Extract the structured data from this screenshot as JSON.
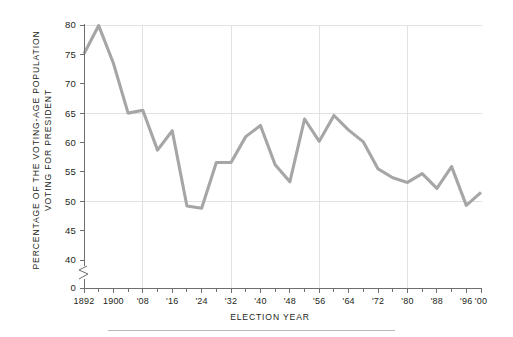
{
  "figure": {
    "background_color": "#ffffff",
    "line_color": "#a6a6a6",
    "grid_color": "#e2e2e2",
    "axis_color": "#6d6e70",
    "text_color": "#231f20"
  },
  "axis_titles": {
    "y_line1": "PERCENTAGE OF THE VOTING-AGE POPULATION",
    "y_line2": "VOTING FOR PRESIDENT",
    "x": "ELECTION  YEAR"
  },
  "y_axis": {
    "ticks": [
      "0",
      "40",
      "45",
      "50",
      "55",
      "60",
      "65",
      "70",
      "75",
      "80"
    ],
    "break_between": [
      "0",
      "40"
    ]
  },
  "x_axis": {
    "tick_labels": [
      "1892",
      "1900",
      "'08",
      "'16",
      "'24",
      "'32",
      "'40",
      "'48",
      "'56",
      "'64",
      "'72",
      "'80",
      "'88",
      "'96",
      "'00"
    ]
  },
  "chart_data": {
    "type": "line",
    "title": "",
    "subtitle": "",
    "xlabel": "ELECTION  YEAR",
    "ylabel": "PERCENTAGE OF THE VOTING-AGE POPULATION VOTING FOR PRESIDENT",
    "ylim": [
      40,
      80
    ],
    "y_break": [
      0,
      40
    ],
    "yticks": [
      0,
      40,
      45,
      50,
      55,
      60,
      65,
      70,
      75,
      80
    ],
    "xlim": [
      1892,
      2000
    ],
    "xticks": [
      1892,
      1900,
      1908,
      1916,
      1924,
      1932,
      1940,
      1948,
      1956,
      1964,
      1972,
      1980,
      1988,
      1996,
      2000
    ],
    "xtick_labels": [
      "1892",
      "1900",
      "'08",
      "'16",
      "'24",
      "'32",
      "'40",
      "'48",
      "'56",
      "'64",
      "'72",
      "'80",
      "'88",
      "'96",
      "'00"
    ],
    "grid": {
      "horizontal_at": [
        50,
        65,
        80
      ],
      "vertical_at": [
        1908,
        1932,
        1956,
        1980
      ]
    },
    "legend": "none",
    "x": [
      1892,
      1896,
      1900,
      1904,
      1908,
      1912,
      1916,
      1920,
      1924,
      1928,
      1932,
      1936,
      1940,
      1944,
      1948,
      1952,
      1956,
      1960,
      1964,
      1968,
      1972,
      1976,
      1980,
      1984,
      1988,
      1992,
      1996,
      2000
    ],
    "values": [
      75.1,
      79.9,
      73.5,
      65.0,
      65.5,
      58.7,
      62.0,
      49.2,
      48.8,
      56.6,
      56.6,
      61.0,
      62.9,
      56.2,
      53.3,
      64.0,
      60.2,
      64.6,
      62.1,
      60.1,
      55.5,
      54.0,
      53.2,
      54.7,
      52.2,
      55.9,
      49.3,
      51.5
    ],
    "series": [
      {
        "name": "Voter turnout",
        "color": "#a6a6a6",
        "values": [
          75.1,
          79.9,
          73.5,
          65.0,
          65.5,
          58.7,
          62.0,
          49.2,
          48.8,
          56.6,
          56.6,
          61.0,
          62.9,
          56.2,
          53.3,
          64.0,
          60.2,
          64.6,
          62.1,
          60.1,
          55.5,
          54.0,
          53.2,
          54.7,
          52.2,
          55.9,
          49.3,
          51.5
        ]
      }
    ]
  }
}
